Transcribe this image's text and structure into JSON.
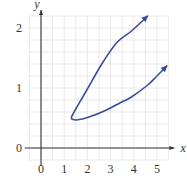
{
  "chart_data": {
    "type": "line",
    "title": "",
    "xlabel": "x",
    "ylabel": "y",
    "xlim": [
      -0.5,
      5.5
    ],
    "ylim": [
      -0.2,
      2.2
    ],
    "grid": true,
    "grid_step_x": 0.5,
    "grid_step_y": 0.2,
    "xticks": [
      0,
      1,
      2,
      3,
      4,
      5
    ],
    "xtick_labels": [
      "0",
      "1",
      "2",
      "3",
      "4",
      "5"
    ],
    "yticks": [
      0,
      1,
      2
    ],
    "ytick_labels": [
      "0",
      "1",
      "2"
    ],
    "series": [
      {
        "name": "parametric curve",
        "color": "#3b4a9a",
        "arrow_ends": true,
        "points": [
          [
            4.6,
            2.2
          ],
          [
            3.9,
            1.95
          ],
          [
            3.3,
            1.77
          ],
          [
            2.7,
            1.45
          ],
          [
            2.2,
            1.12
          ],
          [
            1.8,
            0.85
          ],
          [
            1.5,
            0.65
          ],
          [
            1.32,
            0.52
          ],
          [
            1.35,
            0.48
          ],
          [
            1.6,
            0.47
          ],
          [
            2.1,
            0.52
          ],
          [
            2.8,
            0.63
          ],
          [
            3.4,
            0.75
          ],
          [
            3.9,
            0.85
          ],
          [
            4.6,
            1.05
          ],
          [
            5.0,
            1.2
          ],
          [
            5.43,
            1.37
          ]
        ]
      }
    ]
  }
}
